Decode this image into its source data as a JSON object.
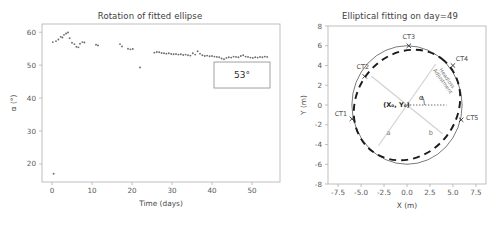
{
  "figure": {
    "panels": [
      "rotation-scatter",
      "elliptical-fitting"
    ]
  },
  "left_panel": {
    "title": "Rotation of fitted ellipse",
    "annotation": "53°"
  },
  "right_panel": {
    "title": "Elliptical fitting on day=49",
    "center_label": "(X₀, Y₀)",
    "alpha_label": "α",
    "semi_major_label": "a",
    "semi_minor_label": "b",
    "headloss_line1": "Headloss",
    "headloss_line2": "Adjustment",
    "ct_labels": [
      "CT1",
      "CT2",
      "CT3",
      "CT4",
      "CT5"
    ]
  },
  "chart_data": [
    {
      "type": "scatter",
      "title": "Rotation of fitted ellipse",
      "xlabel": "Time (days)",
      "ylabel": "α (°)",
      "xlim": [
        -2.5,
        57
      ],
      "ylim": [
        14.5,
        62.5
      ],
      "xticks": [
        0,
        10,
        20,
        30,
        40,
        50
      ],
      "yticks": [
        20,
        30,
        40,
        50,
        60
      ],
      "grid": false,
      "legend": null,
      "annotations": [
        {
          "text": "53°",
          "x": 47.5,
          "y": 47.0,
          "boxed": true
        }
      ],
      "x": [
        0.2,
        1.0,
        1.6,
        2.2,
        2.6,
        3.0,
        3.5,
        4.0,
        4.4,
        5.0,
        5.6,
        6.1,
        6.6,
        7.0,
        7.6,
        8.1,
        11.0,
        11.5,
        17.0,
        17.5,
        19.0,
        19.6,
        20.2,
        22.0,
        25.6,
        26.2,
        26.8,
        27.4,
        28.0,
        28.6,
        29.2,
        29.8,
        30.4,
        31.0,
        31.6,
        32.2,
        32.8,
        33.4,
        34.0,
        34.6,
        35.2,
        35.8,
        36.4,
        37.0,
        37.6,
        38.2,
        38.8,
        39.4,
        40.0,
        40.6,
        41.2,
        41.8,
        42.4,
        43.0,
        43.6,
        44.2,
        44.8,
        45.4,
        46.0,
        46.6,
        47.2,
        47.8,
        48.4,
        49.0,
        49.6,
        50.2,
        50.8,
        51.4,
        52.0,
        52.6,
        53.2,
        53.8,
        0.4
      ],
      "y": [
        57.0,
        57.3,
        57.8,
        58.6,
        58.4,
        59.2,
        59.6,
        59.9,
        58.2,
        56.8,
        56.4,
        55.6,
        55.4,
        56.5,
        57.0,
        56.9,
        56.2,
        56.0,
        56.4,
        55.7,
        55.0,
        54.8,
        54.9,
        49.3,
        53.8,
        54.0,
        53.9,
        53.7,
        53.6,
        53.5,
        53.6,
        53.4,
        53.3,
        53.4,
        53.2,
        53.3,
        53.1,
        53.2,
        53.0,
        52.9,
        53.6,
        53.2,
        54.2,
        53.5,
        53.0,
        52.8,
        52.9,
        52.7,
        52.8,
        52.6,
        52.5,
        52.4,
        52.0,
        51.8,
        52.2,
        52.4,
        52.3,
        52.6,
        52.5,
        52.4,
        52.8,
        53.0,
        52.6,
        52.5,
        52.3,
        52.2,
        52.4,
        52.3,
        52.5,
        52.4,
        52.6,
        52.5,
        17.0
      ]
    },
    {
      "type": "scatter",
      "title": "Elliptical fitting on day=49",
      "xlabel": "X (m)",
      "ylabel": "Y (m)",
      "xlim": [
        -8.6,
        8.6
      ],
      "ylim": [
        -8.0,
        8.0
      ],
      "xticks": [
        -7.5,
        -5.0,
        -2.5,
        0.0,
        2.5,
        5.0,
        7.5
      ],
      "yticks": [
        -8,
        -6,
        -4,
        -2,
        0,
        2,
        4,
        6,
        8
      ],
      "grid": false,
      "legend": null,
      "reference_circle": {
        "cx": 0.0,
        "cy": 0.0,
        "r": 6.0,
        "style": "solid"
      },
      "fitted_ellipse": {
        "cx": 0.0,
        "cy": 0.0,
        "a": 6.3,
        "b": 5.1,
        "rotation_deg": 53,
        "style": "dashed"
      },
      "center": {
        "x": 0.0,
        "y": 0.0,
        "label": "(X₀, Y₀)"
      },
      "alpha_deg": 53,
      "markers": [
        {
          "name": "CT1",
          "x": -6.0,
          "y": -1.4
        },
        {
          "name": "CT2",
          "x": -4.6,
          "y": 2.9
        },
        {
          "name": "CT3",
          "x": 0.2,
          "y": 6.0
        },
        {
          "name": "CT4",
          "x": 5.0,
          "y": 4.0
        },
        {
          "name": "CT5",
          "x": 5.9,
          "y": -1.5
        }
      ],
      "annotations": [
        {
          "text": "Headloss Adjustment",
          "x": 4.2,
          "y": 2.6,
          "rotation_deg": -55
        },
        {
          "text": "a",
          "x": -2.0,
          "y": -3.0
        },
        {
          "text": "b",
          "x": 2.6,
          "y": -3.0
        }
      ]
    }
  ]
}
